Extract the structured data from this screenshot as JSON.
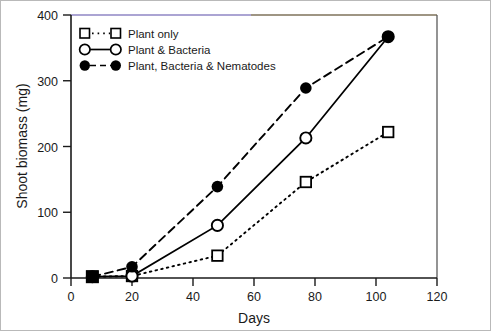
{
  "chart_data": {
    "type": "line",
    "title": "",
    "xlabel": "Days",
    "ylabel": "Shoot biomass (mg)",
    "xlim": [
      0,
      120
    ],
    "ylim": [
      0,
      400
    ],
    "xticks": [
      0,
      20,
      40,
      60,
      80,
      100,
      120
    ],
    "yticks": [
      0,
      100,
      200,
      300,
      400
    ],
    "xtick_labels": [
      "0",
      "20",
      "40",
      "60",
      "80",
      "100",
      "120"
    ],
    "ytick_labels": [
      "0",
      "100",
      "200",
      "300",
      "400"
    ],
    "grid": false,
    "legend_position": "top-left",
    "series": [
      {
        "name": "Plant only",
        "marker": "open-square",
        "line_style": "dotted",
        "color": "#000000",
        "x": [
          7,
          20,
          48,
          77,
          104
        ],
        "values": [
          2,
          3,
          34,
          146,
          222
        ]
      },
      {
        "name": "Plant & Bacteria",
        "marker": "open-circle",
        "line_style": "solid",
        "color": "#000000",
        "x": [
          7,
          20,
          48,
          77,
          104
        ],
        "values": [
          2,
          3,
          80,
          213,
          367
        ]
      },
      {
        "name": "Plant, Bacteria & Nematodes",
        "marker": "filled-circle",
        "line_style": "dashed",
        "color": "#000000",
        "x": [
          7,
          20,
          48,
          77,
          104
        ],
        "values": [
          2,
          17,
          139,
          289,
          367
        ]
      }
    ]
  },
  "legend": {
    "entries": [
      {
        "label": "Plant only"
      },
      {
        "label": "Plant & Bacteria"
      },
      {
        "label": "Plant, Bacteria & Nematodes"
      }
    ]
  },
  "axes": {
    "x_title": "Days",
    "y_title": "Shoot biomass (mg)"
  }
}
